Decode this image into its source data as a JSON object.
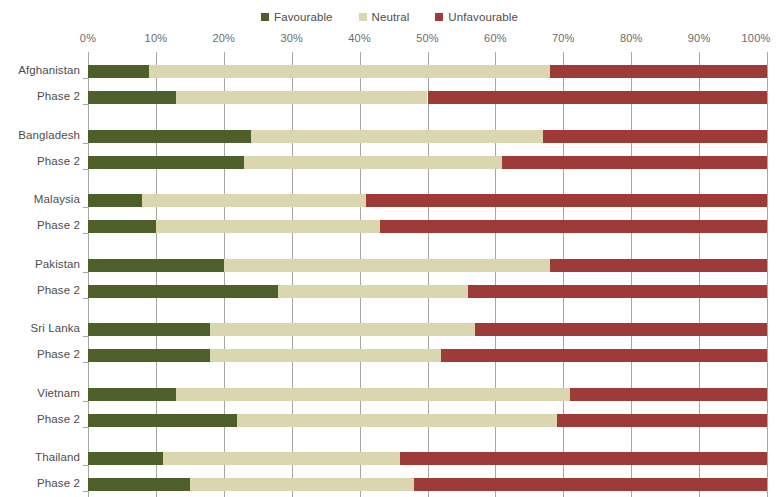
{
  "legend": {
    "position": "top-center",
    "items": [
      {
        "label": "Favourable",
        "color": "#4f5f2a",
        "key": "favourable"
      },
      {
        "label": "Neutral",
        "color": "#d9d6b0",
        "key": "neutral"
      },
      {
        "label": "Unfavourable",
        "color": "#9e3b38",
        "key": "unfavourable"
      }
    ]
  },
  "axis": {
    "ticks": [
      "0%",
      "10%",
      "20%",
      "30%",
      "40%",
      "50%",
      "60%",
      "70%",
      "80%",
      "90%",
      "100%"
    ]
  },
  "chart_data": {
    "type": "bar",
    "orientation": "horizontal",
    "stacked": true,
    "stack_mode": "percent",
    "title": "",
    "subtitle": "",
    "xlabel": "",
    "ylabel": "",
    "xlim": [
      0,
      100
    ],
    "xticks": [
      0,
      10,
      20,
      30,
      40,
      50,
      60,
      70,
      80,
      90,
      100
    ],
    "xtick_labels": [
      "0%",
      "10%",
      "20%",
      "30%",
      "40%",
      "50%",
      "60%",
      "70%",
      "80%",
      "90%",
      "100%"
    ],
    "grid": true,
    "grid_axis": "x",
    "legend": [
      "Favourable",
      "Neutral",
      "Unfavourable"
    ],
    "legend_position": "top-center",
    "colors": {
      "favourable": "#4f5f2a",
      "neutral": "#d9d6b0",
      "unfavourable": "#9e3b38"
    },
    "groups": [
      {
        "name": "Afghanistan",
        "rows": [
          {
            "label": "Afghanistan",
            "favourable": 9,
            "neutral": 59,
            "unfavourable": 32
          },
          {
            "label": "Phase 2",
            "favourable": 13,
            "neutral": 37,
            "unfavourable": 50
          }
        ]
      },
      {
        "name": "Bangladesh",
        "rows": [
          {
            "label": "Bangladesh",
            "favourable": 24,
            "neutral": 43,
            "unfavourable": 33
          },
          {
            "label": "Phase 2",
            "favourable": 23,
            "neutral": 38,
            "unfavourable": 39
          }
        ]
      },
      {
        "name": "Malaysia",
        "rows": [
          {
            "label": "Malaysia",
            "favourable": 8,
            "neutral": 33,
            "unfavourable": 59
          },
          {
            "label": "Phase 2",
            "favourable": 10,
            "neutral": 33,
            "unfavourable": 57
          }
        ]
      },
      {
        "name": "Pakistan",
        "rows": [
          {
            "label": "Pakistan",
            "favourable": 20,
            "neutral": 48,
            "unfavourable": 32
          },
          {
            "label": "Phase 2",
            "favourable": 28,
            "neutral": 28,
            "unfavourable": 44
          }
        ]
      },
      {
        "name": "Sri Lanka",
        "rows": [
          {
            "label": "Sri Lanka",
            "favourable": 18,
            "neutral": 39,
            "unfavourable": 43
          },
          {
            "label": "Phase 2",
            "favourable": 18,
            "neutral": 34,
            "unfavourable": 48
          }
        ]
      },
      {
        "name": "Vietnam",
        "rows": [
          {
            "label": "Vietnam",
            "favourable": 13,
            "neutral": 58,
            "unfavourable": 29
          },
          {
            "label": "Phase 2",
            "favourable": 22,
            "neutral": 47,
            "unfavourable": 31
          }
        ]
      },
      {
        "name": "Thailand",
        "rows": [
          {
            "label": "Thailand",
            "favourable": 11,
            "neutral": 35,
            "unfavourable": 54
          },
          {
            "label": "Phase 2",
            "favourable": 15,
            "neutral": 33,
            "unfavourable": 52
          }
        ]
      }
    ]
  }
}
